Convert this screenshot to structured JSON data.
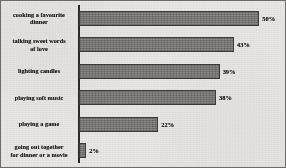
{
  "chart_data": {
    "type": "bar",
    "orientation": "horizontal",
    "title": "",
    "subtitle": "",
    "xlabel": "",
    "ylabel": "",
    "xlim": [
      0,
      56
    ],
    "grid": false,
    "legend": null,
    "value_suffix": "%",
    "categories": [
      "cooking a favourite dinner",
      "talking sweet words of love",
      "lighting candles",
      "playing soft music",
      "playing a game",
      "going out together for dinner or a movie"
    ],
    "values": [
      50,
      43,
      39,
      38,
      22,
      2
    ],
    "data_labels": [
      "50%",
      "43%",
      "39%",
      "38%",
      "22%",
      "2%"
    ],
    "bars": [
      {
        "label": "cooking a favourite dinner",
        "label_lines": [
          "cooking a favourite",
          "dinner"
        ],
        "value": 50,
        "display": "50%"
      },
      {
        "label": "talking sweet words of love",
        "label_lines": [
          "talking sweet words",
          "of love"
        ],
        "value": 43,
        "display": "43%"
      },
      {
        "label": "lighting candles",
        "label_lines": [
          "lighting candles"
        ],
        "value": 39,
        "display": "39%"
      },
      {
        "label": "playing soft music",
        "label_lines": [
          "playing soft music"
        ],
        "value": 38,
        "display": "38%"
      },
      {
        "label": "playing a game",
        "label_lines": [
          "playing a game"
        ],
        "value": 22,
        "display": "22%"
      },
      {
        "label": "going out together for dinner or a movie",
        "label_lines": [
          "going out together",
          "for dinner or a movie"
        ],
        "value": 2,
        "display": "2%"
      }
    ]
  },
  "style": {
    "bar_color": "#7b7a76",
    "bar_border_color": "#3c3b38",
    "axis_color": "#2b2a28",
    "background": "#e8e7e3",
    "text_color": "#1d1c1a",
    "frame_color": "#6d6c68"
  }
}
